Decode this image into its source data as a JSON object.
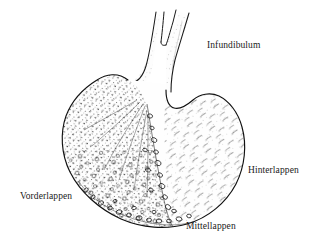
{
  "figure": {
    "background_color": "#ffffff",
    "ink_color": "#1a1a1a",
    "width": 319,
    "height": 247
  },
  "labels": {
    "infundibulum": "Infundibulum",
    "hinterlappen": "Hinterlappen",
    "vorderlappen": "Vorderlappen",
    "mittellappen": "Mittellappen"
  },
  "regions": [
    {
      "name": "infundibulum",
      "label": "Infundibulum",
      "description": "stalk rising from the top of the gland, split by a narrow V-notch into two prongs"
    },
    {
      "name": "vorderlappen",
      "label": "Vorderlappen",
      "description": "anterior lobe, left portion, dense stippled glandular tissue with cell clusters"
    },
    {
      "name": "hinterlappen",
      "label": "Hinterlappen",
      "description": "posterior lobe, right portion, lighter fibrous neural tissue"
    },
    {
      "name": "mittellappen",
      "label": "Mittellappen",
      "description": "intermediate lobe, row of small follicles along the lower border"
    }
  ]
}
